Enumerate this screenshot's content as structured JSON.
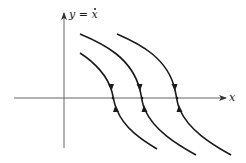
{
  "figure": {
    "type": "phase-plane",
    "axes": {
      "x_label": "x",
      "y_label_prefix": "y = ",
      "y_label_var": "x",
      "y_label_full": "y = ẋ"
    },
    "trajectories": [
      {
        "name": "trajectory-1",
        "crossing_direction": "converging on x-axis from above and below"
      },
      {
        "name": "trajectory-2",
        "crossing_direction": "converging on x-axis from above and below"
      },
      {
        "name": "trajectory-3",
        "crossing_direction": "converging on x-axis from above and below"
      }
    ],
    "colors": {
      "stroke": "#1a1a1a",
      "axis": "#333333",
      "background": "#ffffff"
    }
  }
}
